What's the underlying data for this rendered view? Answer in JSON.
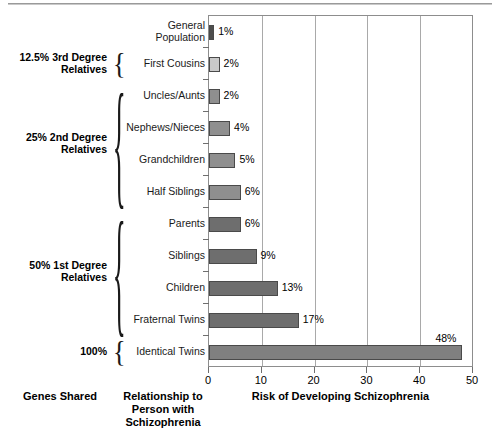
{
  "chart_data": {
    "type": "bar",
    "orientation": "horizontal",
    "title": "",
    "xlabel": "Risk of Developing Schizophrenia",
    "ylabel": "Relationship to\nPerson with\nSchizophrenia",
    "xlim": [
      0,
      50
    ],
    "xticks": [
      0,
      10,
      20,
      30,
      40,
      50
    ],
    "xtick_labels": [
      "0",
      "10",
      "20",
      "30",
      "40",
      "50"
    ],
    "grid": "vertical",
    "legend": "none",
    "categories": [
      "General\nPopulation",
      "First Cousins",
      "Uncles/Aunts",
      "Nephews/Nieces",
      "Grandchildren",
      "Half Siblings",
      "Parents",
      "Siblings",
      "Children",
      "Fraternal Twins",
      "Identical Twins"
    ],
    "values": [
      1,
      2,
      2,
      4,
      5,
      6,
      6,
      9,
      13,
      17,
      48
    ],
    "value_labels": [
      "1%",
      "2%",
      "2%",
      "4%",
      "5%",
      "6%",
      "6%",
      "9%",
      "13%",
      "17%",
      "48%"
    ],
    "bar_colors": [
      "#4d4d4d",
      "#c9c9c9",
      "#8f8f8f",
      "#8f8f8f",
      "#8f8f8f",
      "#8f8f8f",
      "#6e6e6e",
      "#6e6e6e",
      "#6e6e6e",
      "#6e6e6e",
      "#808080"
    ],
    "bar_edge_color": "#4a4a4a",
    "frame_color": "#8d8d8d",
    "grid_color": "#a9a9a9"
  },
  "groups": {
    "axis_title": "Genes Shared",
    "items": [
      {
        "label": "12.5% 3rd Degree\nRelatives",
        "members": [
          "First Cousins"
        ]
      },
      {
        "label": "25% 2nd Degree\nRelatives",
        "members": [
          "Uncles/Aunts",
          "Nephews/Nieces",
          "Grandchildren",
          "Half Siblings"
        ]
      },
      {
        "label": "50% 1st Degree\nRelatives",
        "members": [
          "Parents",
          "Siblings",
          "Children",
          "Fraternal Twins"
        ]
      },
      {
        "label": "100%",
        "members": [
          "Identical Twins"
        ]
      }
    ]
  },
  "braces": {
    "glyph": "{"
  }
}
